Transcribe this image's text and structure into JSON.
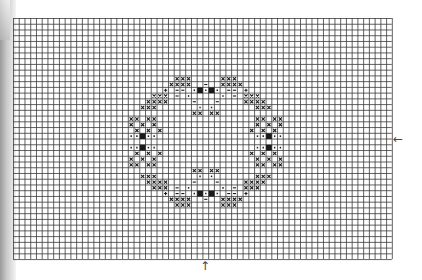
{
  "chart": {
    "cols": 66,
    "rows": 42,
    "cell": 5.74,
    "grid_color": "#3a3a3a",
    "stitch_color": "#1a1a1a",
    "motif_note": "Approximate motif placement; symmetric pattern reconstructed from blurry source, not exact per-cell transcription"
  },
  "markers": {
    "right_center_arrow": "←",
    "bottom_center_arrow": "↑"
  },
  "chart_data": {
    "type": "table",
    "legend": [
      {
        "symbol": "x",
        "meaning": "cross stitch"
      },
      {
        "symbol": "-",
        "meaning": "dash stitch"
      },
      {
        "symbol": "·",
        "meaning": "dot stitch"
      },
      {
        "symbol": "■",
        "meaning": "solid fill"
      },
      {
        "symbol": "+",
        "meaning": "plus stitch"
      }
    ],
    "center_col": 33,
    "center_row": 21,
    "note": "Coordinates are estimated from the overall motif shape rather than read cell-by-cell"
  }
}
